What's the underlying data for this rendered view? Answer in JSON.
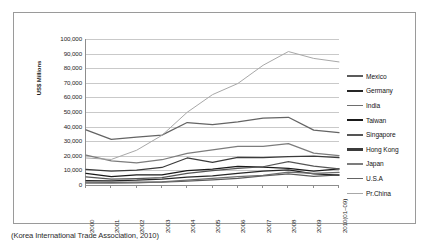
{
  "caption": "(Korea International Trade Association, 2010)",
  "chart_data": {
    "type": "line",
    "title": "",
    "xlabel": "",
    "ylabel": "US$ Millions",
    "ylim": [
      0,
      100000
    ],
    "grid": true,
    "legend_position": "right",
    "categories": [
      "2000",
      "2001",
      "2002",
      "2003",
      "2004",
      "2005",
      "2006",
      "2007",
      "2008",
      "2009",
      "2010(01~09)"
    ],
    "ytick_labels": [
      "100,000",
      "90,000",
      "80,000",
      "70,000",
      "60,000",
      "50,000",
      "40,000",
      "30,000",
      "20,000",
      "10,000",
      "0"
    ],
    "ytick_values": [
      100000,
      90000,
      80000,
      70000,
      60000,
      50000,
      40000,
      30000,
      20000,
      10000,
      0
    ],
    "series": [
      {
        "name": "Mexico",
        "color": "#5b5b5b",
        "values": [
          1900,
          1800,
          1900,
          2000,
          2600,
          3500,
          4600,
          6300,
          7600,
          5900,
          6900
        ]
      },
      {
        "name": "Germany",
        "color": "#262626",
        "values": [
          3000,
          2900,
          3300,
          4100,
          5400,
          6300,
          7900,
          9500,
          10300,
          7600,
          6800
        ]
      },
      {
        "name": "India",
        "color": "#6e6e6e",
        "values": [
          1300,
          1300,
          1500,
          2200,
          3400,
          4600,
          5800,
          6600,
          8900,
          8000,
          8600
        ]
      },
      {
        "name": "Taiwan",
        "color": "#1a1a1a",
        "values": [
          8000,
          5700,
          6900,
          7000,
          9800,
          10800,
          12700,
          12200,
          11400,
          9500,
          11000
        ]
      },
      {
        "name": "Singapore",
        "color": "#555555",
        "values": [
          5600,
          4100,
          4400,
          5000,
          8000,
          9900,
          11400,
          12500,
          16000,
          13000,
          11000
        ]
      },
      {
        "name": "Hong Kong",
        "color": "#3b3b3b",
        "values": [
          10700,
          9500,
          10200,
          12000,
          18500,
          15500,
          18900,
          18800,
          19400,
          19700,
          18700
        ]
      },
      {
        "name": "Japan",
        "color": "#7c7c7c",
        "values": [
          20500,
          16500,
          15100,
          17300,
          21700,
          24000,
          26500,
          26400,
          28300,
          21800,
          20100
        ]
      },
      {
        "name": "U.S.A",
        "color": "#646464",
        "values": [
          37800,
          31200,
          32800,
          34200,
          42800,
          41300,
          43200,
          45800,
          46400,
          37600,
          35900
        ]
      },
      {
        "name": "Pr.China",
        "color": "#a8a8a8",
        "values": [
          18500,
          17500,
          23800,
          34000,
          49800,
          61900,
          69500,
          82000,
          91400,
          86700,
          84300
        ]
      }
    ]
  }
}
